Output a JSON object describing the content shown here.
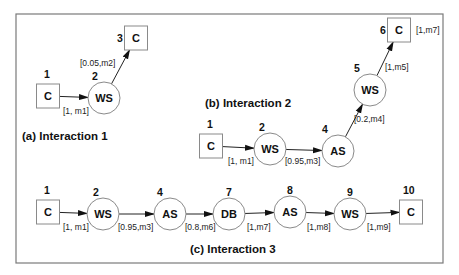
{
  "frame": {
    "x": 16,
    "y": 14,
    "w": 427,
    "h": 249
  },
  "interactions": [
    {
      "title": "(a) Interaction 1",
      "title_pos": [
        22,
        140
      ],
      "nodes": [
        {
          "id": "1",
          "label": "C",
          "shape": "rect",
          "x": 48,
          "y": 96,
          "num_pos": [
            44,
            78
          ]
        },
        {
          "id": "2",
          "label": "WS",
          "shape": "circle",
          "x": 104,
          "y": 98,
          "num_pos": [
            92,
            80
          ]
        },
        {
          "id": "3",
          "label": "C",
          "shape": "rect",
          "x": 136,
          "y": 38,
          "num_pos": [
            117,
            42
          ]
        }
      ],
      "edges": [
        {
          "from": "1",
          "to": "2",
          "label": "[1, m1]",
          "label_pos": [
            63,
            114
          ]
        },
        {
          "from": "2",
          "to": "3",
          "label": "[0.05,m2]",
          "label_pos": [
            80,
            66
          ]
        }
      ]
    },
    {
      "title": "(b) Interaction 2",
      "title_pos": [
        205,
        107
      ],
      "nodes": [
        {
          "id": "1",
          "label": "C",
          "shape": "rect",
          "x": 211,
          "y": 146,
          "num_pos": [
            207,
            128
          ]
        },
        {
          "id": "2",
          "label": "WS",
          "shape": "circle",
          "x": 270,
          "y": 149,
          "num_pos": [
            259,
            131
          ]
        },
        {
          "id": "4",
          "label": "AS",
          "shape": "circle",
          "x": 338,
          "y": 151,
          "num_pos": [
            322,
            133
          ]
        },
        {
          "id": "5",
          "label": "WS",
          "shape": "circle",
          "x": 370,
          "y": 90,
          "num_pos": [
            354,
            72
          ]
        },
        {
          "id": "6",
          "label": "C",
          "shape": "rect",
          "x": 399,
          "y": 30,
          "num_pos": [
            380,
            34
          ]
        }
      ],
      "edges": [
        {
          "from": "1",
          "to": "2",
          "label": "[1, m1]",
          "label_pos": [
            228,
            164
          ]
        },
        {
          "from": "2",
          "to": "4",
          "label": "[0.95,m3]",
          "label_pos": [
            285,
            164
          ]
        },
        {
          "from": "4",
          "to": "5",
          "label": "[0.2,m4]",
          "label_pos": [
            354,
            122
          ]
        },
        {
          "from": "5",
          "to": "6",
          "label": "[1,m5]",
          "label_pos": [
            385,
            70
          ]
        }
      ],
      "extra_labels": [
        {
          "text": "[1,m7]",
          "pos": [
            416,
            33
          ]
        }
      ]
    },
    {
      "title": "(c) Interaction 3",
      "title_pos": [
        190,
        253
      ],
      "nodes": [
        {
          "id": "1",
          "label": "C",
          "shape": "rect",
          "x": 48,
          "y": 212,
          "num_pos": [
            44,
            194
          ]
        },
        {
          "id": "2",
          "label": "WS",
          "shape": "circle",
          "x": 103,
          "y": 214,
          "num_pos": [
            93,
            196
          ]
        },
        {
          "id": "4",
          "label": "AS",
          "shape": "circle",
          "x": 170,
          "y": 214,
          "num_pos": [
            157,
            196
          ]
        },
        {
          "id": "7",
          "label": "DB",
          "shape": "circle",
          "x": 229,
          "y": 214,
          "num_pos": [
            226,
            196
          ]
        },
        {
          "id": "8",
          "label": "AS",
          "shape": "circle",
          "x": 290,
          "y": 212,
          "num_pos": [
            287,
            194
          ]
        },
        {
          "id": "9",
          "label": "WS",
          "shape": "circle",
          "x": 350,
          "y": 214,
          "num_pos": [
            347,
            196
          ]
        },
        {
          "id": "10",
          "label": "C",
          "shape": "rect",
          "x": 411,
          "y": 212,
          "num_pos": [
            403,
            194
          ]
        }
      ],
      "edges": [
        {
          "from": "1",
          "to": "2",
          "label": "[1, m1]",
          "label_pos": [
            63,
            230
          ]
        },
        {
          "from": "2",
          "to": "4",
          "label": "[0.95,m3]",
          "label_pos": [
            118,
            230
          ]
        },
        {
          "from": "4",
          "to": "7",
          "label": "[0.8,m6]",
          "label_pos": [
            185,
            230
          ]
        },
        {
          "from": "7",
          "to": "8",
          "label": "[1,m7]",
          "label_pos": [
            247,
            230
          ]
        },
        {
          "from": "8",
          "to": "9",
          "label": "[1,m8]",
          "label_pos": [
            307,
            230
          ]
        },
        {
          "from": "9",
          "to": "10",
          "label": "[1,m9]",
          "label_pos": [
            367,
            230
          ]
        }
      ]
    }
  ]
}
